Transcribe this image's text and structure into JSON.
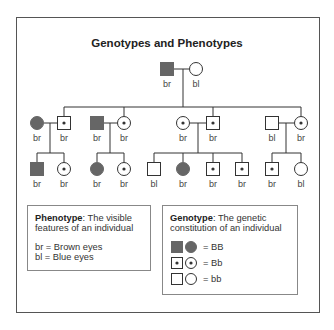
{
  "title": "Genotypes and Phenotypes",
  "colors": {
    "affected_fill": "#666666",
    "stroke": "#333333",
    "frame": "#555555",
    "box_border": "#888888"
  },
  "pedigree": {
    "generation_1": [
      {
        "sex": "male",
        "genotype": "BB",
        "phenotype": "br",
        "x": 167,
        "y": 69
      },
      {
        "sex": "female",
        "genotype": "bb",
        "phenotype": "bl",
        "x": 196,
        "y": 69
      }
    ],
    "generation_2": [
      {
        "sex": "female",
        "genotype": "BB",
        "phenotype": "br",
        "x": 37,
        "y": 123,
        "role": "spouse"
      },
      {
        "sex": "male",
        "genotype": "Bb",
        "phenotype": "br",
        "x": 64,
        "y": 123,
        "role": "child"
      },
      {
        "sex": "male",
        "genotype": "BB",
        "phenotype": "br",
        "x": 97,
        "y": 123,
        "role": "spouse"
      },
      {
        "sex": "female",
        "genotype": "Bb",
        "phenotype": "br",
        "x": 124,
        "y": 123,
        "role": "child"
      },
      {
        "sex": "female",
        "genotype": "Bb",
        "phenotype": "br",
        "x": 183,
        "y": 123,
        "role": "spouse"
      },
      {
        "sex": "male",
        "genotype": "Bb",
        "phenotype": "br",
        "x": 213,
        "y": 123,
        "role": "child"
      },
      {
        "sex": "male",
        "genotype": "bb",
        "phenotype": "bl",
        "x": 272,
        "y": 123,
        "role": "spouse"
      },
      {
        "sex": "female",
        "genotype": "Bb",
        "phenotype": "br",
        "x": 301,
        "y": 123,
        "role": "child"
      }
    ],
    "generation_3": [
      {
        "sex": "male",
        "genotype": "BB",
        "phenotype": "br",
        "x": 37,
        "y": 169
      },
      {
        "sex": "female",
        "genotype": "Bb",
        "phenotype": "br",
        "x": 64,
        "y": 169
      },
      {
        "sex": "female",
        "genotype": "BB",
        "phenotype": "br",
        "x": 97,
        "y": 169
      },
      {
        "sex": "female",
        "genotype": "Bb",
        "phenotype": "br",
        "x": 124,
        "y": 169
      },
      {
        "sex": "male",
        "genotype": "bb",
        "phenotype": "bl",
        "x": 154,
        "y": 169
      },
      {
        "sex": "female",
        "genotype": "BB",
        "phenotype": "br",
        "x": 183,
        "y": 169
      },
      {
        "sex": "male",
        "genotype": "Bb",
        "phenotype": "br",
        "x": 213,
        "y": 169
      },
      {
        "sex": "male",
        "genotype": "Bb",
        "phenotype": "br",
        "x": 242,
        "y": 169
      },
      {
        "sex": "male",
        "genotype": "Bb",
        "phenotype": "br",
        "x": 272,
        "y": 169
      },
      {
        "sex": "female",
        "genotype": "bb",
        "phenotype": "bl",
        "x": 301,
        "y": 169
      }
    ],
    "lines": [
      [
        174,
        69,
        189,
        69
      ],
      [
        183,
        69,
        183,
        107
      ],
      [
        64,
        107,
        301,
        107
      ],
      [
        64,
        107,
        64,
        116
      ],
      [
        124,
        107,
        124,
        116
      ],
      [
        213,
        107,
        213,
        116
      ],
      [
        301,
        107,
        301,
        116
      ],
      [
        44,
        123,
        57,
        123
      ],
      [
        50,
        123,
        50,
        153
      ],
      [
        37,
        153,
        64,
        153
      ],
      [
        37,
        153,
        37,
        162
      ],
      [
        64,
        153,
        64,
        162
      ],
      [
        104,
        123,
        117,
        123
      ],
      [
        110,
        123,
        110,
        153
      ],
      [
        97,
        153,
        124,
        153
      ],
      [
        97,
        153,
        97,
        162
      ],
      [
        124,
        153,
        124,
        162
      ],
      [
        190,
        123,
        206,
        123
      ],
      [
        198,
        123,
        198,
        153
      ],
      [
        154,
        153,
        242,
        153
      ],
      [
        154,
        153,
        154,
        162
      ],
      [
        183,
        153,
        183,
        162
      ],
      [
        213,
        153,
        213,
        162
      ],
      [
        242,
        153,
        242,
        162
      ],
      [
        279,
        123,
        294,
        123
      ],
      [
        286,
        123,
        286,
        153
      ],
      [
        272,
        153,
        301,
        153
      ],
      [
        272,
        153,
        272,
        162
      ],
      [
        301,
        153,
        301,
        162
      ]
    ]
  },
  "phenotype_box": {
    "heading": "Phenotype",
    "definition": ": The visible features of an individual",
    "key": [
      "br = Brown eyes",
      "bl = Blue eyes"
    ]
  },
  "genotype_box": {
    "heading": "Genotype",
    "definition": ": The genetic constitution of an individual",
    "key": [
      {
        "genotype": "BB",
        "label": "= BB"
      },
      {
        "genotype": "Bb",
        "label": "= Bb"
      },
      {
        "genotype": "bb",
        "label": "= bb"
      }
    ]
  }
}
